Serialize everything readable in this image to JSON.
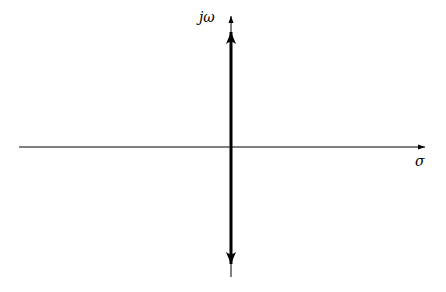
{
  "diagram": {
    "type": "s-plane",
    "axes": {
      "vertical_label": "jω",
      "horizontal_label": "σ"
    },
    "highlighted_segment": {
      "description": "bold double-headed arrow along the imaginary axis",
      "color": "#000000"
    },
    "colors": {
      "axis": "#000000",
      "background": "#ffffff"
    }
  }
}
